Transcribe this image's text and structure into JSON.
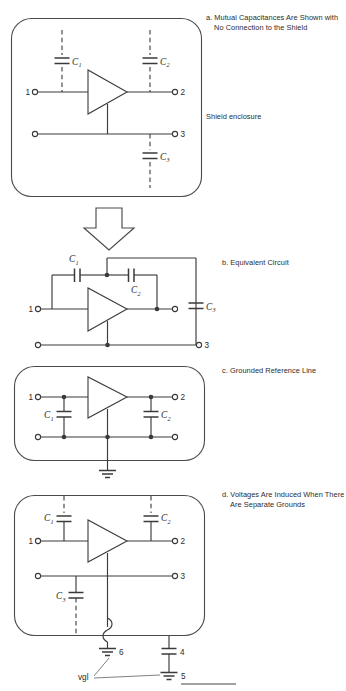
{
  "figure": {
    "stroke_color": "#3a3a3a",
    "text_color": "#2b2b2b",
    "background": "#ffffff"
  },
  "captions": {
    "a": "a. Mutual Capacitances Are Shown with No Connection to the Shield",
    "shield": "Shield enclosure",
    "b": "b. Equivalent Circuit",
    "c": "c. Grounded Reference Line",
    "d": "d. Voltages Are Induced When There Are Separate Grounds"
  },
  "panels": {
    "a": {
      "id": "panel-a",
      "enclosure": "shield-enclosure",
      "component_labels": [
        "C1",
        "C2",
        "C3"
      ],
      "terminal_labels": [
        "1",
        "2",
        "3"
      ],
      "capacitors": [
        {
          "name": "C1",
          "label": "C",
          "sub": "1",
          "style": "dashed"
        },
        {
          "name": "C2",
          "label": "C",
          "sub": "2",
          "style": "dashed"
        },
        {
          "name": "C3",
          "label": "C",
          "sub": "3",
          "style": "dashed"
        }
      ],
      "terminals": [
        {
          "name": "terminal-1",
          "label": "1",
          "side": "left"
        },
        {
          "name": "terminal-2",
          "label": "2",
          "side": "right"
        },
        {
          "name": "terminal-3",
          "label": "3",
          "side": "right"
        }
      ],
      "amplifier": "amplifier-triangle"
    },
    "b": {
      "id": "panel-b",
      "capacitors": [
        {
          "name": "C1",
          "label": "C",
          "sub": "1",
          "style": "solid"
        },
        {
          "name": "C2",
          "label": "C",
          "sub": "2",
          "style": "solid"
        },
        {
          "name": "C3",
          "label": "C",
          "sub": "3",
          "style": "solid"
        }
      ],
      "terminals": [
        {
          "name": "terminal-1",
          "label": "1",
          "side": "left"
        },
        {
          "name": "terminal-3",
          "label": "3",
          "side": "right"
        }
      ],
      "amplifier": "amplifier-triangle"
    },
    "c": {
      "id": "panel-c",
      "enclosure": "shield-enclosure",
      "capacitors": [
        {
          "name": "C1",
          "label": "C",
          "sub": "1",
          "style": "solid"
        },
        {
          "name": "C2",
          "label": "C",
          "sub": "2",
          "style": "solid"
        }
      ],
      "terminals": [
        {
          "name": "terminal-1",
          "label": "1",
          "side": "left"
        },
        {
          "name": "terminal-2",
          "label": "2",
          "side": "right"
        }
      ],
      "ground": "ground-symbol",
      "amplifier": "amplifier-triangle"
    },
    "d": {
      "id": "panel-d",
      "enclosure": "shield-enclosure",
      "capacitors": [
        {
          "name": "C1",
          "label": "C",
          "sub": "1",
          "style": "dashed"
        },
        {
          "name": "C2",
          "label": "C",
          "sub": "2",
          "style": "dashed"
        },
        {
          "name": "C3",
          "label": "C",
          "sub": "3",
          "style": "dashed"
        },
        {
          "name": "C4",
          "label": "4",
          "style": "solid"
        }
      ],
      "terminals": [
        {
          "name": "terminal-1",
          "label": "1",
          "side": "left"
        },
        {
          "name": "terminal-2",
          "label": "2",
          "side": "right"
        },
        {
          "name": "terminal-3",
          "label": "3",
          "side": "right"
        }
      ],
      "grounds": [
        {
          "name": "ground-6",
          "label": "6"
        },
        {
          "name": "ground-5",
          "label": "5"
        }
      ],
      "node_labels": [
        {
          "name": "node-4",
          "label": "4"
        },
        {
          "name": "node-6",
          "label": "6"
        },
        {
          "name": "node-5",
          "label": "5"
        }
      ],
      "voltage_label": "vgl",
      "amplifier": "amplifier-triangle"
    }
  },
  "symbols": {
    "c1": "C",
    "c1_sub": "1",
    "c2": "C",
    "c2_sub": "2",
    "c3": "C",
    "c3_sub": "3",
    "t1": "1",
    "t2": "2",
    "t3": "3",
    "n4": "4",
    "n5": "5",
    "n6": "6",
    "vgl": "vgl"
  },
  "arrow": {
    "name": "down-arrow",
    "direction": "down"
  }
}
